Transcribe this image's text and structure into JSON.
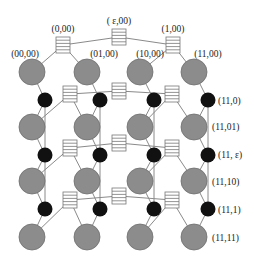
{
  "colors": {
    "background": "#ffffff",
    "edge": "#8a8a8a",
    "host_fill": "#8c8c8c",
    "host_stroke": "#6e6e6e",
    "router_fill": "#111111",
    "switch_fill": "#ffffff",
    "switch_stroke": "#777777",
    "label": "#222222"
  },
  "top_labels": {
    "root": "( ε,00)",
    "left": "(0,00)",
    "right": "(1,00)",
    "h0": "(00,00)",
    "h1": "(01,00)",
    "h2": "(10,00)",
    "h3": "(11,00)"
  },
  "side_labels": [
    {
      "text": "(11,0)",
      "x": 218,
      "y": 104
    },
    {
      "text": "(11,01)",
      "x": 212,
      "y": 130
    },
    {
      "text": "(11, ε)",
      "x": 218,
      "y": 158
    },
    {
      "text": "(11,10)",
      "x": 212,
      "y": 185
    },
    {
      "text": "(11,1)",
      "x": 218,
      "y": 213
    },
    {
      "text": "(11,11)",
      "x": 212,
      "y": 241
    }
  ],
  "switches": [
    {
      "id": "(ε,00)",
      "x": 119,
      "y": 37
    },
    {
      "id": "(0,00)",
      "x": 63,
      "y": 45
    },
    {
      "id": "(1,00)",
      "x": 173,
      "y": 45
    },
    {
      "id": "row2-left",
      "x": 70,
      "y": 94
    },
    {
      "id": "row2-mid",
      "x": 119,
      "y": 91
    },
    {
      "id": "row2-right",
      "x": 172,
      "y": 94
    },
    {
      "id": "row3-left",
      "x": 70,
      "y": 148
    },
    {
      "id": "row3-mid",
      "x": 119,
      "y": 143
    },
    {
      "id": "row3-right",
      "x": 172,
      "y": 148
    },
    {
      "id": "row4-left",
      "x": 70,
      "y": 200
    },
    {
      "id": "row4-mid",
      "x": 119,
      "y": 196
    },
    {
      "id": "row4-right",
      "x": 172,
      "y": 200
    }
  ],
  "hosts_x": [
    32,
    87,
    140,
    194
  ],
  "hosts_y": [
    72,
    127,
    181,
    237
  ],
  "routers_x": [
    45,
    100,
    154,
    208
  ],
  "routers_y": [
    100,
    155,
    209
  ]
}
